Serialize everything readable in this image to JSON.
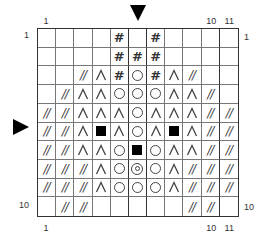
{
  "chart": {
    "title": "",
    "columns": 11,
    "rows": 10,
    "top_labels": [
      {
        "text": "1",
        "col": 1
      },
      {
        "text": "10",
        "col": 10
      },
      {
        "text": "11",
        "col": 11
      }
    ],
    "bottom_labels": [
      {
        "text": "1",
        "col": 1
      },
      {
        "text": "10",
        "col": 10
      },
      {
        "text": "11",
        "col": 11
      }
    ],
    "left_labels": [
      {
        "text": "1",
        "row": 1
      },
      {
        "text": "10",
        "row": 10
      }
    ],
    "right_labels": [
      {
        "text": "1",
        "row": 1
      },
      {
        "text": "10",
        "row": 10
      }
    ],
    "markers": {
      "top_arrow": {
        "icon": "down-triangle-icon",
        "col": 6
      },
      "left_arrow": {
        "icon": "right-triangle-icon",
        "row": 6
      }
    },
    "thick_vertical_lines_after_cols": [
      5,
      6,
      10
    ],
    "symbol_legend": {
      "": "empty",
      "#": "hash",
      "//": "double-slash",
      "^": "caret",
      "o": "circle",
      "oo": "double-circle",
      "s": "filled-square"
    },
    "grid": [
      [
        "",
        "",
        "",
        "",
        "#",
        "",
        "#",
        "",
        "",
        "",
        ""
      ],
      [
        "",
        "",
        "",
        "",
        "#",
        "#",
        "#",
        "",
        "",
        "",
        ""
      ],
      [
        "",
        "",
        "//",
        "^",
        "#",
        "o",
        "#",
        "^",
        "//",
        "",
        ""
      ],
      [
        "",
        "//",
        "^",
        "^",
        "o",
        "o",
        "o",
        "^",
        "^",
        "//",
        ""
      ],
      [
        "//",
        "//",
        "^",
        "^",
        "^",
        "o",
        "^",
        "^",
        "^",
        "//",
        "//"
      ],
      [
        "//",
        "//",
        "^",
        "s",
        "^",
        "o",
        "^",
        "s",
        "^",
        "//",
        "//"
      ],
      [
        "//",
        "//",
        "^",
        "^",
        "o",
        "s",
        "o",
        "^",
        "^",
        "//",
        "//"
      ],
      [
        "//",
        "//",
        "//",
        "^",
        "o",
        "oo",
        "o",
        "^",
        "//",
        "//",
        "//"
      ],
      [
        "//",
        "//",
        "//",
        "^",
        "o",
        "o",
        "o",
        "^",
        "//",
        "//",
        "//"
      ],
      [
        "",
        "//",
        "//",
        "",
        "",
        "",
        "",
        "",
        "//",
        "//",
        ""
      ]
    ]
  }
}
